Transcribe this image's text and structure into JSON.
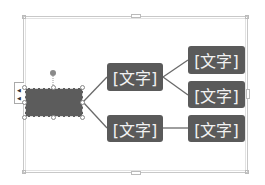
{
  "diagram": {
    "type": "horizontal-hierarchy",
    "root": {
      "text": "",
      "selected": true
    },
    "level1": [
      {
        "text": "[文字]",
        "children": [
          {
            "text": "[文字]"
          },
          {
            "text": "[文字]"
          }
        ]
      },
      {
        "text": "[文字]",
        "children": [
          {
            "text": "[文字]"
          }
        ]
      }
    ]
  },
  "nodes": {
    "mid_top": "[文字]",
    "mid_bottom": "[文字]",
    "right_1": "[文字]",
    "right_2": "[文字]",
    "right_3": "[文字]"
  },
  "colors": {
    "node_fill": "#5a5a5a",
    "node_text": "#f2f2f2",
    "connector": "#6a6a6a",
    "frame": "#c8c8c8"
  }
}
